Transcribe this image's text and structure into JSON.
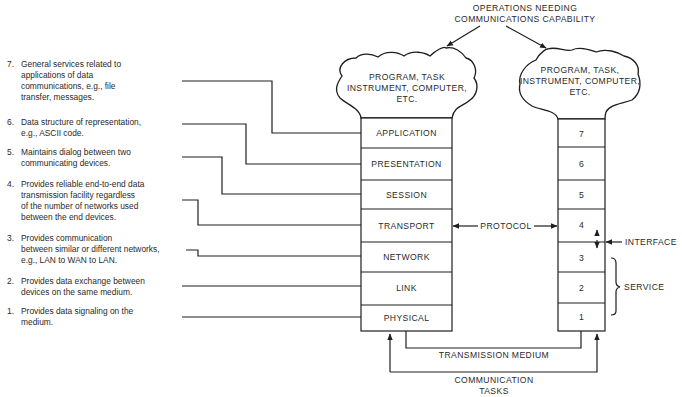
{
  "title": {
    "line1": "OPERATIONS NEEDING",
    "line2": "COMMUNICATIONS CAPABILITY"
  },
  "clouds": {
    "left": {
      "line1": "PROGRAM, TASK",
      "line2": "INSTRUMENT, COMPUTER,",
      "line3": "ETC."
    },
    "right": {
      "line1": "PROGRAM, TASK,",
      "line2": "INSTRUMENT, COMPUTER,",
      "line3": "ETC."
    }
  },
  "layers": [
    {
      "number": "7",
      "name": "APPLICATION"
    },
    {
      "number": "6",
      "name": "PRESENTATION"
    },
    {
      "number": "5",
      "name": "SESSION"
    },
    {
      "number": "4",
      "name": "TRANSPORT"
    },
    {
      "number": "3",
      "name": "NETWORK"
    },
    {
      "number": "2",
      "name": "LINK"
    },
    {
      "number": "1",
      "name": "PHYSICAL"
    }
  ],
  "descriptions": [
    {
      "number": "7.",
      "lines": [
        "General services related to",
        "applications of data",
        "communications, e.g., file",
        "transfer, messages."
      ]
    },
    {
      "number": "6.",
      "lines": [
        "Data structure of representation,",
        "e.g., ASCII code."
      ]
    },
    {
      "number": "5.",
      "lines": [
        "Maintains dialog between two",
        "communicating devices."
      ]
    },
    {
      "number": "4.",
      "lines": [
        "Provides reliable end-to-end data",
        "transmission facility regardless",
        "of the number of networks used",
        "between the end devices."
      ]
    },
    {
      "number": "3.",
      "lines": [
        "Provides communication",
        "between similar or different networks,",
        "e.g., LAN to WAN to LAN."
      ]
    },
    {
      "number": "2.",
      "lines": [
        "Provides data exchange between",
        "devices on the same medium."
      ]
    },
    {
      "number": "1.",
      "lines": [
        "Provides data signaling on the",
        "medium."
      ]
    }
  ],
  "labels": {
    "protocol": "PROTOCOL",
    "interface": "INTERFACE",
    "service": "SERVICE",
    "transmission_medium": "TRANSMISSION MEDIUM",
    "communication_tasks_line1": "COMMUNICATION",
    "communication_tasks_line2": "TASKS"
  }
}
